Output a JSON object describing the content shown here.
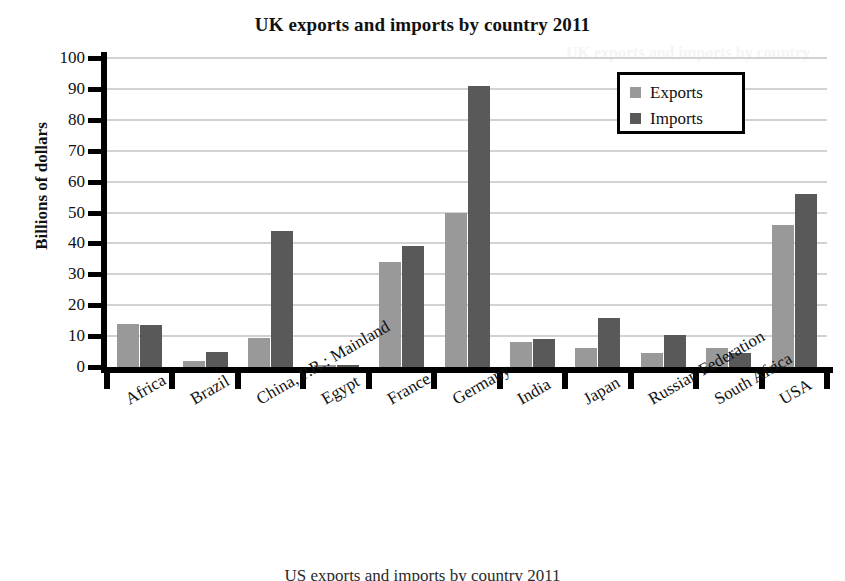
{
  "chart_data": {
    "type": "bar",
    "title": "UK exports and imports by country 2011",
    "xlabel": "",
    "ylabel": "Billions of dollars",
    "ylim": [
      0,
      100
    ],
    "ytick_step": 10,
    "grid": true,
    "legend_position": "top-right",
    "categories": [
      "Africa",
      "Brazil",
      "China, P.R.: Mainland",
      "Egypt",
      "France",
      "Germany",
      "India",
      "Japan",
      "Russian Federation",
      "South Africa",
      "USA"
    ],
    "yticks": [
      "0",
      "10",
      "20",
      "30",
      "40",
      "50",
      "60",
      "70",
      "80",
      "90",
      "100"
    ],
    "series": [
      {
        "name": "Exports",
        "color": "#999999",
        "values": [
          14,
          2,
          9.5,
          0.5,
          34,
          50,
          8,
          6,
          4.5,
          6,
          46
        ]
      },
      {
        "name": "Imports",
        "color": "#595959",
        "values": [
          13.5,
          5,
          44,
          0.5,
          39,
          91,
          9,
          16,
          10.5,
          4.5,
          56
        ]
      }
    ]
  },
  "legend": {
    "items": [
      {
        "label": "Exports",
        "color": "#999999"
      },
      {
        "label": "Imports",
        "color": "#595959"
      }
    ]
  },
  "bottom_caption": "US exports and imports by country 2011",
  "ghost_text": "UK exports and imports by country"
}
